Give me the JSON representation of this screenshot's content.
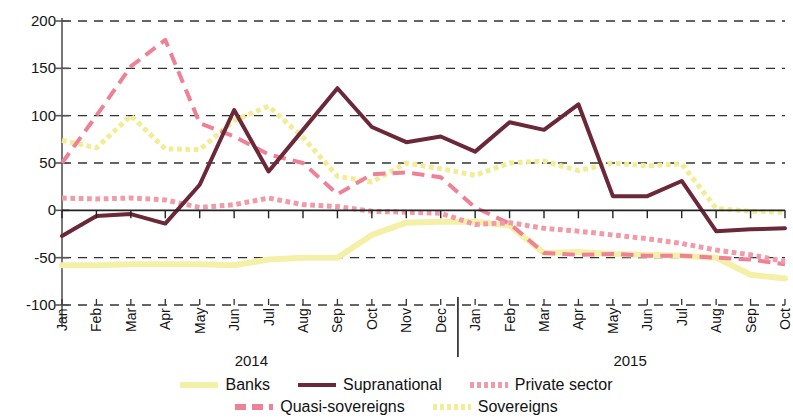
{
  "chart_data": {
    "type": "line",
    "title": "",
    "subtitle": "",
    "xlabel": "",
    "ylabel": "",
    "ylim": [
      -100,
      200
    ],
    "yticks": [
      200,
      150,
      100,
      50,
      0,
      -50,
      -100
    ],
    "ytick_labels": [
      "200",
      "150",
      "100",
      "50",
      "0",
      "-50",
      "-100"
    ],
    "grid": true,
    "grid_style": "dashed horizontal",
    "legend_position": "bottom",
    "x": [
      "Jan",
      "Feb",
      "Mar",
      "Apr",
      "May",
      "Jun",
      "Jul",
      "Aug",
      "Sep",
      "Oct",
      "Nov",
      "Dec",
      "Jan",
      "Feb",
      "Mar",
      "Apr",
      "May",
      "Jun",
      "Jul",
      "Aug",
      "Sep",
      "Oct"
    ],
    "categories": [
      "Jan",
      "Feb",
      "Mar",
      "Apr",
      "May",
      "Jun",
      "Jul",
      "Aug",
      "Sep",
      "Oct",
      "Nov",
      "Dec",
      "Jan",
      "Feb",
      "Mar",
      "Apr",
      "May",
      "Jun",
      "Jul",
      "Aug",
      "Sep",
      "Oct"
    ],
    "year_groups": [
      {
        "label": "2014",
        "start_index": 0,
        "end_index": 11
      },
      {
        "label": "2015",
        "start_index": 12,
        "end_index": 21
      }
    ],
    "separator_after_index": 11,
    "series": [
      {
        "name": "Banks",
        "color": "#f5f0a8",
        "style": "solid",
        "width": 6,
        "values": [
          -58,
          -58,
          -57,
          -57,
          -57,
          -58,
          -52,
          -50,
          -50,
          -26,
          -13,
          -12,
          -12,
          -16,
          -45,
          -44,
          -46,
          -47,
          -48,
          -50,
          -68,
          -72
        ]
      },
      {
        "name": "Supranational",
        "color": "#6b2838",
        "style": "solid",
        "width": 4,
        "values": [
          -27,
          -6,
          -4,
          -14,
          27,
          106,
          41,
          85,
          129,
          88,
          72,
          78,
          62,
          93,
          85,
          112,
          15,
          15,
          31,
          -22,
          -20,
          -19
        ]
      },
      {
        "name": "Private sector",
        "color": "#f19aa8",
        "style": "dotted",
        "width": 5,
        "values": [
          13,
          12,
          13,
          11,
          3,
          6,
          13,
          6,
          4,
          -1,
          -2,
          -3,
          -15,
          -13,
          -19,
          -22,
          -26,
          -30,
          -35,
          -42,
          -47,
          -54
        ]
      },
      {
        "name": "Quasi-sovereigns",
        "color": "#ef8197",
        "style": "dashed",
        "width": 4,
        "values": [
          50,
          100,
          152,
          180,
          92,
          78,
          59,
          50,
          17,
          38,
          40,
          35,
          3,
          -14,
          -45,
          -47,
          -46,
          -48,
          -48,
          -50,
          -52,
          -57
        ]
      },
      {
        "name": "Sovereigns",
        "color": "#f2ec94",
        "style": "dotted",
        "width": 5,
        "values": [
          74,
          66,
          100,
          65,
          64,
          95,
          110,
          77,
          36,
          30,
          50,
          44,
          37,
          50,
          52,
          42,
          50,
          47,
          49,
          2,
          -1,
          -2
        ]
      }
    ]
  },
  "legend": {
    "rows": [
      [
        {
          "label": "Banks",
          "color": "#f5f0a8",
          "style": "solid"
        },
        {
          "label": "Supranational",
          "color": "#6b2838",
          "style": "solid"
        },
        {
          "label": "Private sector",
          "color": "#f19aa8",
          "style": "dotted"
        }
      ],
      [
        {
          "label": "Quasi-sovereigns",
          "color": "#ef8197",
          "style": "dashed"
        },
        {
          "label": "Sovereigns",
          "color": "#f2ec94",
          "style": "dotted"
        }
      ]
    ]
  },
  "axis": {
    "zero_line_color": "#222222",
    "grid_color": "#333333",
    "axis_color": "#555555"
  }
}
